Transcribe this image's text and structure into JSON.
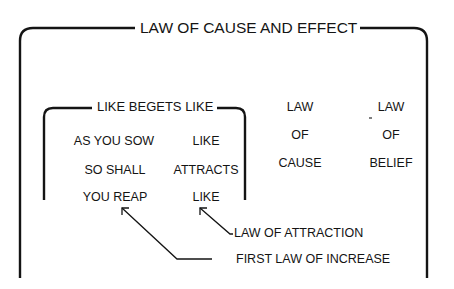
{
  "diagram": {
    "title": "LAW OF CAUSE AND EFFECT",
    "inner_box": {
      "title": "LIKE BEGETS LIKE",
      "left_column": [
        "AS YOU SOW",
        "SO SHALL",
        "YOU REAP"
      ],
      "right_column": [
        "LIKE",
        "ATTRACTS",
        "LIKE"
      ]
    },
    "columns": [
      {
        "lines": [
          "LAW",
          "OF",
          "CAUSE"
        ]
      },
      {
        "lines": [
          "LAW",
          "OF",
          "BELIEF"
        ]
      }
    ],
    "annotations": [
      {
        "label": "LAW OF ATTRACTION",
        "points_to": "LIKE"
      },
      {
        "label": "FIRST LAW OF INCREASE",
        "points_to": "YOU REAP"
      }
    ],
    "line_color": "#141414"
  }
}
